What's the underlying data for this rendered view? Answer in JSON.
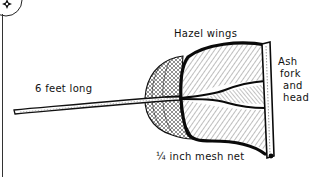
{
  "diagram": {
    "labels": {
      "wings": "Hazel wings",
      "handle": "6 feet long",
      "head_lines": [
        "Ash",
        "fork",
        "and",
        "head"
      ],
      "mesh": "¼ inch mesh net"
    },
    "parts": [
      "badge-ornament",
      "handle",
      "mesh-net",
      "hazel-wings-frame",
      "ash-fork-head"
    ],
    "colors": {
      "ink": "#111111",
      "background": "#ffffff",
      "hatch": "#555555"
    }
  }
}
